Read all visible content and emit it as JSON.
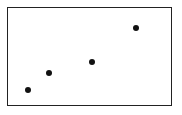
{
  "chart_data": {
    "type": "scatter",
    "title": "",
    "xlabel": "",
    "ylabel": "",
    "grid": false,
    "legend": null,
    "series": [
      {
        "name": "points",
        "color": "#111111",
        "points": [
          {
            "x": 1,
            "y": 1
          },
          {
            "x": 2,
            "y": 2
          },
          {
            "x": 4,
            "y": 3
          },
          {
            "x": 6,
            "y": 5
          }
        ]
      }
    ],
    "pixel_positions": [
      {
        "px": 28,
        "py": 90
      },
      {
        "px": 49,
        "py": 73
      },
      {
        "px": 92,
        "py": 62
      },
      {
        "px": 136,
        "py": 28
      }
    ],
    "frame": {
      "left": 7,
      "top": 7,
      "right": 172,
      "bottom": 106
    },
    "marker_radius": 3
  }
}
